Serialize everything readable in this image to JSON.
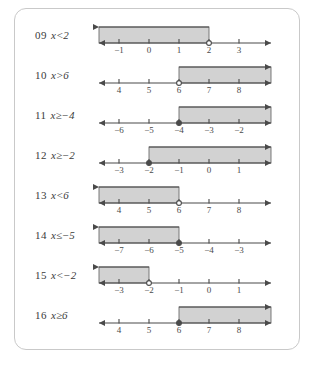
{
  "panel": {
    "title": "inequality-number-line-answers",
    "border_color": "#c9c9c9",
    "shade_fill": "#d2d2d2",
    "shade_stroke": "#6e6e6e",
    "line_color": "#4a4a4a"
  },
  "rows": [
    {
      "number": "09",
      "variable": "x",
      "operator": "<",
      "value": "2",
      "inequality": "x<2",
      "ticks": [
        "−1",
        "0",
        "1",
        "2",
        "3"
      ],
      "boundary_index": 3,
      "direction": "left",
      "endpoint": "open"
    },
    {
      "number": "10",
      "variable": "x",
      "operator": ">",
      "value": "6",
      "inequality": "x>6",
      "ticks": [
        "4",
        "5",
        "6",
        "7",
        "8"
      ],
      "boundary_index": 2,
      "direction": "right",
      "endpoint": "open"
    },
    {
      "number": "11",
      "variable": "x",
      "operator": "≥",
      "value": "−4",
      "inequality": "x≥−4",
      "ticks": [
        "−6",
        "−5",
        "−4",
        "−3",
        "−2"
      ],
      "boundary_index": 2,
      "direction": "right",
      "endpoint": "closed"
    },
    {
      "number": "12",
      "variable": "x",
      "operator": "≥",
      "value": "−2",
      "inequality": "x≥−2",
      "ticks": [
        "−3",
        "−2",
        "−1",
        "0",
        "1"
      ],
      "boundary_index": 1,
      "direction": "right",
      "endpoint": "closed"
    },
    {
      "number": "13",
      "variable": "x",
      "operator": "<",
      "value": "6",
      "inequality": "x<6",
      "ticks": [
        "4",
        "5",
        "6",
        "7",
        "8"
      ],
      "boundary_index": 2,
      "direction": "left",
      "endpoint": "open"
    },
    {
      "number": "14",
      "variable": "x",
      "operator": "≤",
      "value": "−5",
      "inequality": "x≤−5",
      "ticks": [
        "−7",
        "−6",
        "−5",
        "−4",
        "−3"
      ],
      "boundary_index": 2,
      "direction": "left",
      "endpoint": "closed"
    },
    {
      "number": "15",
      "variable": "x",
      "operator": "<",
      "value": "−2",
      "inequality": "x<−2",
      "ticks": [
        "−3",
        "−2",
        "−1",
        "0",
        "1"
      ],
      "boundary_index": 1,
      "direction": "left",
      "endpoint": "open"
    },
    {
      "number": "16",
      "variable": "x",
      "operator": "≥",
      "value": "6",
      "inequality": "x≥6",
      "ticks": [
        "4",
        "5",
        "6",
        "7",
        "8"
      ],
      "boundary_index": 2,
      "direction": "right",
      "endpoint": "closed"
    }
  ]
}
